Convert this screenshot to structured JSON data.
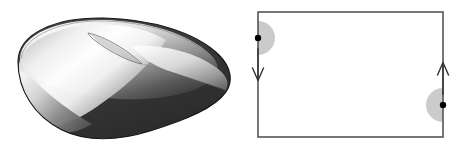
{
  "figure": {
    "caption": "",
    "background_color": "#ffffff",
    "width": 471,
    "height": 148
  },
  "panels": [
    {
      "id": "mobius-surface",
      "name": "mobius-strip-rendering",
      "description": "Shaded three-dimensional rendering of a Mobius strip",
      "colors": {
        "highlight": "#ffffff",
        "light_gray": "#d8d8d8",
        "mid_gray": "#8c8c8c",
        "dark_gray": "#3c3c3c",
        "darker_gray": "#2a2a2a",
        "outline": "#111111"
      }
    },
    {
      "id": "fundamental-polygon",
      "name": "identification-square-diagram",
      "description": "Rectangle with left and right edges identified in opposite directions",
      "rect": {
        "x": 18,
        "y": 12,
        "width": 185,
        "height": 125,
        "stroke": "#555555",
        "stroke_width": 1.6,
        "fill": "#ffffff"
      },
      "points": [
        {
          "name": "point-p-left",
          "label": "p",
          "cx": 18,
          "cy": 38,
          "dot_color": "#000000",
          "dot_radius": 3.2,
          "halfdisk_color": "#cbcbcb",
          "halfdisk_radius": 17,
          "halfdisk_side": "right"
        },
        {
          "name": "point-p-right",
          "label": "p",
          "cx": 203,
          "cy": 105,
          "dot_color": "#000000",
          "dot_radius": 3.2,
          "halfdisk_color": "#cbcbcb",
          "halfdisk_radius": 17,
          "halfdisk_side": "left"
        }
      ],
      "arrows": [
        {
          "name": "left-edge-arrow",
          "direction": "down",
          "edge": "left",
          "x": 18,
          "y_start": 48,
          "y_end": 80,
          "color": "#333333"
        },
        {
          "name": "right-edge-arrow",
          "direction": "up",
          "edge": "right",
          "x": 203,
          "y_start": 95,
          "y_end": 63,
          "color": "#333333"
        }
      ]
    }
  ],
  "labels": {
    "p_left": "p",
    "p_right": "p"
  }
}
